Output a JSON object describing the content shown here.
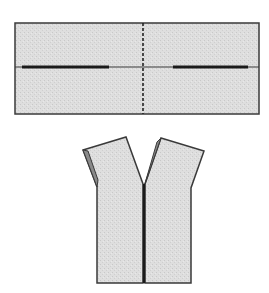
{
  "diagram": {
    "type": "sewing-pattern-illustration",
    "colors": {
      "fabric_fill": "#dcdcdc",
      "outline": "#3a3a3a",
      "fold_line": "#222222",
      "armhole_shade": "#8a8a8a",
      "background": "#ffffff"
    },
    "panels": [
      {
        "id": "flat-rectangle",
        "description": "Flat fabric rectangle with center dashed fold line and two thick cut lines along the horizontal midline"
      },
      {
        "id": "finished-vest",
        "description": "Resulting sleeveless vest with V-neck and center front opening"
      }
    ]
  }
}
